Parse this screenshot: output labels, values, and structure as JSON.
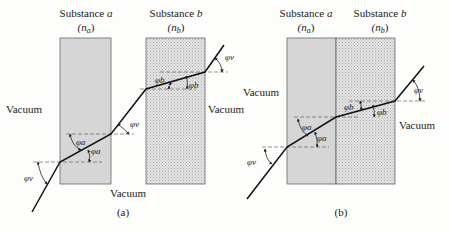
{
  "figure": {
    "panels": [
      {
        "id": "a",
        "caption": "(a)",
        "substance_a": {
          "title": "Substance a",
          "title_prefix": "Substance ",
          "title_var": "a",
          "index_label": "(n",
          "index_sub": "a",
          "index_close": ")"
        },
        "substance_b": {
          "title": "Substance b",
          "title_prefix": "Substance ",
          "title_var": "b",
          "index_label": "(n",
          "index_sub": "b",
          "index_close": ")"
        },
        "medium_labels": [
          "Vacuum",
          "Vacuum",
          "Vacuum"
        ],
        "angle_labels": {
          "phi_v_entry": "φv",
          "phi_a_in": "φa",
          "phi_a_out": "φa",
          "phi_v_mid": "φv",
          "phi_b_in": "φb",
          "phi_b_out": "φb",
          "phi_v_exit": "φv"
        },
        "layout": "slabs separated by vacuum gap"
      },
      {
        "id": "b",
        "caption": "(b)",
        "substance_a": {
          "title": "Substance a",
          "title_prefix": "Substance ",
          "title_var": "a",
          "index_label": "(n",
          "index_sub": "a",
          "index_close": ")"
        },
        "substance_b": {
          "title": "Substance b",
          "title_prefix": "Substance ",
          "title_var": "b",
          "index_label": "(n",
          "index_sub": "b",
          "index_close": ")"
        },
        "medium_labels": [
          "Vacuum",
          "Vacuum"
        ],
        "angle_labels": {
          "phi_v_entry": "φv",
          "phi_a_in": "φa",
          "phi_a_out": "φa",
          "phi_b_in": "φb",
          "phi_b_out": "φb",
          "phi_v_exit": "φv"
        },
        "layout": "slabs in direct contact"
      }
    ],
    "symbols": {
      "phi": "φ",
      "v": "v",
      "a": "a",
      "b": "b"
    },
    "colors": {
      "background": "#fdfdfb",
      "substance_a_fill": "#d6d6d6",
      "substance_b_fill": "#e4e4e4",
      "substance_b_dot": "#a8a8a8",
      "outline": "#555555",
      "ray": "#111111",
      "normal": "#666666"
    }
  }
}
